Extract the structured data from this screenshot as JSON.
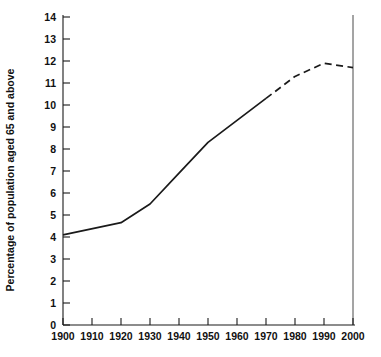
{
  "chart_data": {
    "type": "line",
    "title": "",
    "xlabel": "",
    "ylabel": "Percentage of population aged 65 and above",
    "xlim": [
      1900,
      2000
    ],
    "ylim": [
      0,
      14
    ],
    "grid": false,
    "legend": "none",
    "xticks": [
      1900,
      1910,
      1920,
      1930,
      1940,
      1950,
      1960,
      1970,
      1980,
      1990,
      2000
    ],
    "yticks": [
      0,
      1,
      2,
      3,
      4,
      5,
      6,
      7,
      8,
      9,
      10,
      11,
      12,
      13,
      14
    ],
    "xtick_labels": [
      "1900",
      "1910",
      "1920",
      "1930",
      "1940",
      "1950",
      "1960",
      "1970",
      "1980",
      "1990",
      "2000"
    ],
    "ytick_labels": [
      "0",
      "1",
      "2",
      "3",
      "4",
      "5",
      "6",
      "7",
      "8",
      "9",
      "10",
      "11",
      "12",
      "13",
      "14"
    ],
    "series": [
      {
        "name": "Observed",
        "style": "solid",
        "x": [
          1900,
          1920,
          1930,
          1940,
          1950,
          1960,
          1970
        ],
        "values": [
          4.1,
          4.65,
          5.5,
          6.9,
          8.3,
          9.3,
          10.3
        ]
      },
      {
        "name": "Projected",
        "style": "dashed",
        "x": [
          1970,
          1980,
          1990,
          2000
        ],
        "values": [
          10.3,
          11.3,
          11.9,
          11.7
        ]
      }
    ],
    "annotations": [
      {
        "name": "projection-rule",
        "type": "vertical-line",
        "x": 2000
      }
    ],
    "line_color": "#1a1a1a",
    "axis_color": "#1a1a1a",
    "background_color": "#ffffff"
  }
}
